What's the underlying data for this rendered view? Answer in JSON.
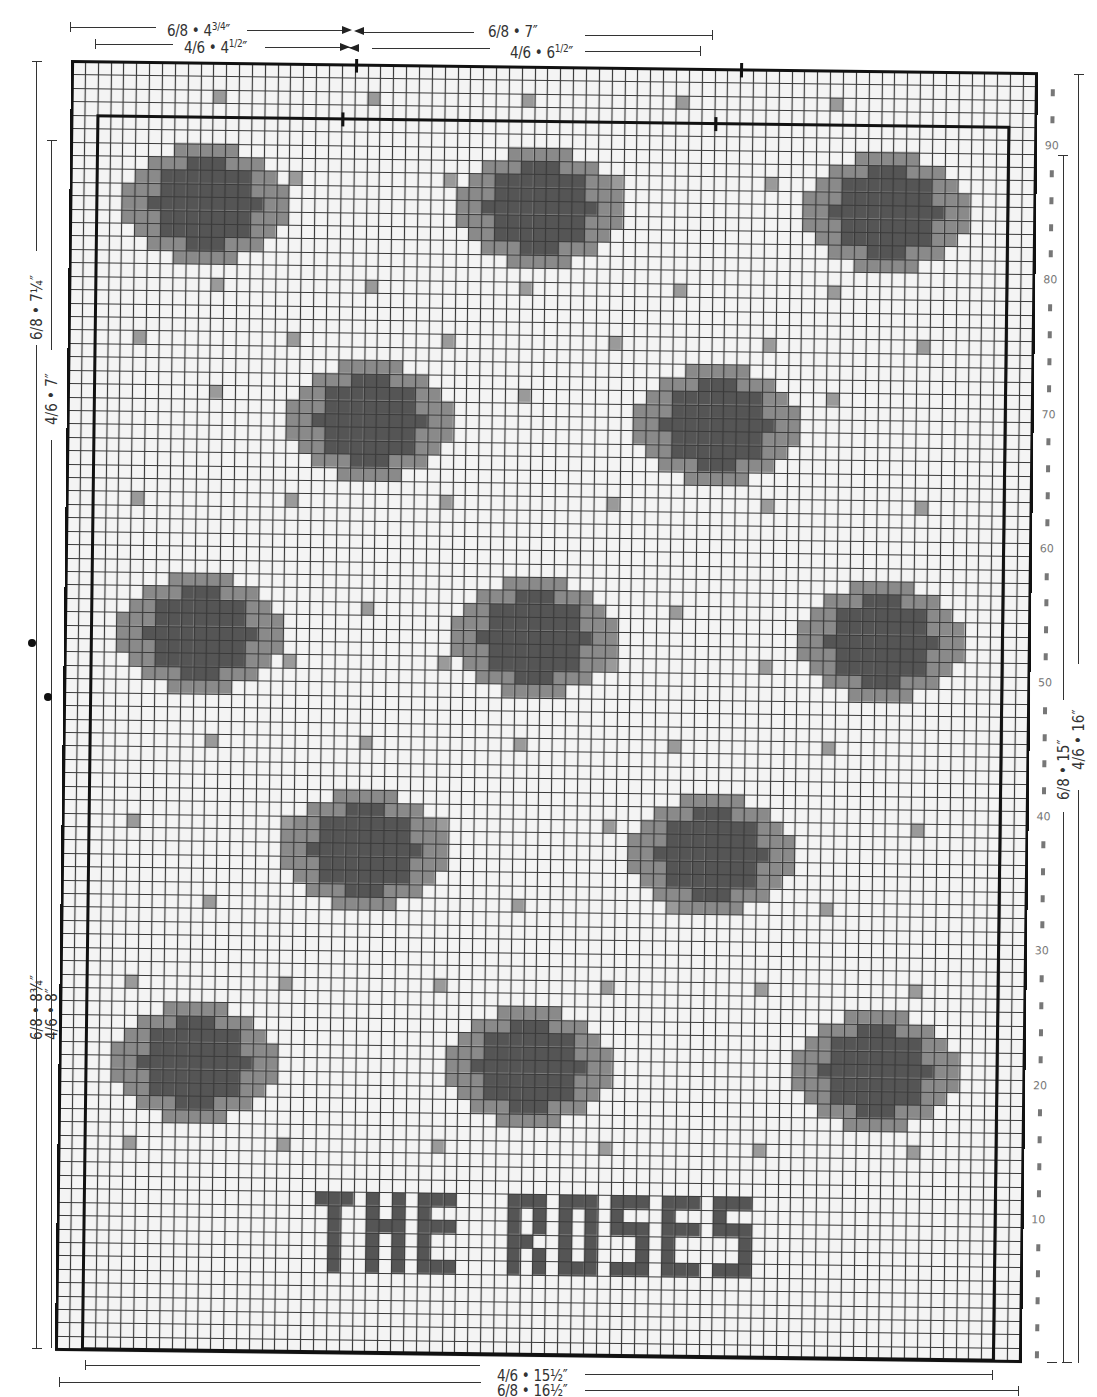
{
  "colors": {
    "background": "#f4f4f4",
    "grid_line": "#3a3a3a",
    "light_cell": "#9a9a9a",
    "medium_cell": "#8a8a8a",
    "dark_cell": "#555555",
    "frame": "#111111",
    "row_number": "#777777"
  },
  "top_dimensions": {
    "left_68": {
      "label": "6/8 • 4",
      "frac": "3/4",
      "unit": "″"
    },
    "left_46": {
      "label": "4/6 • 4",
      "frac": "1/2",
      "unit": "″"
    },
    "right_68": {
      "label": "6/8 • 7″"
    },
    "right_46": {
      "label": "4/6 • 6",
      "frac": "1/2",
      "unit": "″"
    }
  },
  "left_dimensions": {
    "upper_68": "6/8 • 7¼″",
    "upper_46": "4/6 • 7″",
    "lower_68": "6/8 • 8¾″",
    "lower_46": "4/6 • 8″"
  },
  "right_dimensions": {
    "label_68": "6/8 • 15″",
    "label_46": "4/6 • 16″"
  },
  "bottom_dimensions": {
    "label_46": "4/6 • 15½″",
    "label_68": "6/8 • 16½″"
  },
  "row_numbers": [
    "90",
    "80",
    "70",
    "60",
    "50",
    "40",
    "30",
    "20",
    "10"
  ],
  "chart_data": {
    "type": "heatmap",
    "grid": {
      "cols": 75,
      "rows": 96
    },
    "row_axis": {
      "ticks": [
        10,
        20,
        30,
        40,
        50,
        60,
        70,
        80,
        90
      ],
      "side": "right"
    },
    "inner_frame": {
      "col_start": 2,
      "col_end": 73,
      "row_top": 91
    },
    "legend": "light gray = accent stitch, mid gray = rose outer petals, dark gray = rose center / lettering",
    "roses": [
      {
        "row": 85,
        "col": 10
      },
      {
        "row": 85,
        "col": 36
      },
      {
        "row": 85,
        "col": 63
      },
      {
        "row": 69,
        "col": 23
      },
      {
        "row": 69,
        "col": 50
      },
      {
        "row": 53,
        "col": 10
      },
      {
        "row": 53,
        "col": 36
      },
      {
        "row": 53,
        "col": 63
      },
      {
        "row": 37,
        "col": 23
      },
      {
        "row": 37,
        "col": 50
      },
      {
        "row": 21,
        "col": 10
      },
      {
        "row": 21,
        "col": 36
      },
      {
        "row": 21,
        "col": 63
      }
    ],
    "accent_dots": [
      [
        93,
        11
      ],
      [
        93,
        23
      ],
      [
        93,
        35
      ],
      [
        93,
        47
      ],
      [
        93,
        59
      ],
      [
        87,
        5
      ],
      [
        87,
        17
      ],
      [
        87,
        29
      ],
      [
        87,
        42
      ],
      [
        87,
        54
      ],
      [
        87,
        66
      ],
      [
        79,
        11
      ],
      [
        79,
        23
      ],
      [
        79,
        35
      ],
      [
        79,
        47
      ],
      [
        79,
        59
      ],
      [
        75,
        5
      ],
      [
        75,
        17
      ],
      [
        75,
        29
      ],
      [
        75,
        42
      ],
      [
        75,
        54
      ],
      [
        75,
        66
      ],
      [
        63,
        5
      ],
      [
        63,
        17
      ],
      [
        63,
        29
      ],
      [
        63,
        42
      ],
      [
        63,
        54
      ],
      [
        63,
        66
      ],
      [
        71,
        11
      ],
      [
        71,
        35
      ],
      [
        71,
        59
      ],
      [
        55,
        23
      ],
      [
        55,
        47
      ],
      [
        51,
        5
      ],
      [
        51,
        17
      ],
      [
        51,
        29
      ],
      [
        51,
        42
      ],
      [
        51,
        54
      ],
      [
        51,
        66
      ],
      [
        45,
        11
      ],
      [
        45,
        23
      ],
      [
        45,
        35
      ],
      [
        45,
        47
      ],
      [
        45,
        59
      ],
      [
        39,
        5
      ],
      [
        39,
        17
      ],
      [
        39,
        29
      ],
      [
        39,
        42
      ],
      [
        39,
        54
      ],
      [
        39,
        66
      ],
      [
        33,
        11
      ],
      [
        33,
        23
      ],
      [
        33,
        35
      ],
      [
        33,
        47
      ],
      [
        33,
        59
      ],
      [
        27,
        5
      ],
      [
        27,
        17
      ],
      [
        27,
        29
      ],
      [
        27,
        42
      ],
      [
        27,
        54
      ],
      [
        27,
        66
      ],
      [
        15,
        5
      ],
      [
        15,
        17
      ],
      [
        15,
        29
      ],
      [
        15,
        42
      ],
      [
        15,
        54
      ],
      [
        15,
        66
      ]
    ],
    "lettering": {
      "text": "THE ROSES",
      "row_top": 11,
      "col_start": 20,
      "height": 6
    }
  }
}
